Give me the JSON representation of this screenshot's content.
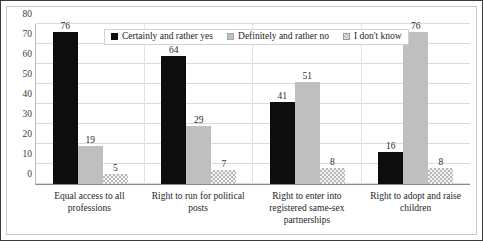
{
  "chart_data": {
    "type": "bar",
    "title": "",
    "xlabel": "",
    "ylabel": "",
    "ylim": [
      0,
      80
    ],
    "yticks": [
      0,
      10,
      20,
      30,
      40,
      50,
      60,
      70,
      80
    ],
    "grid": true,
    "legend_position": "top-center",
    "categories": [
      "Equal access to all professions",
      "Right to run for political posts",
      "Right to enter into registered same-sex partnerships",
      "Right to adopt and raise children"
    ],
    "series": [
      {
        "name": "Certainly and rather yes",
        "color": "#0d0d0d",
        "values": [
          76,
          64,
          41,
          16
        ]
      },
      {
        "name": "Definitely and rather no",
        "color": "#bfbfbf",
        "values": [
          19,
          29,
          51,
          76
        ]
      },
      {
        "name": "I don't know",
        "color": "#f2f2f2",
        "values": [
          5,
          7,
          8,
          8
        ]
      }
    ]
  },
  "colors": {
    "series_yes": "#0d0d0d",
    "series_no": "#bfbfbf",
    "series_dontknow": "#f2f2f2",
    "gridline": "#dcdcdc",
    "axis": "#8a8a8a",
    "frame_border": "#3a3a3a"
  }
}
